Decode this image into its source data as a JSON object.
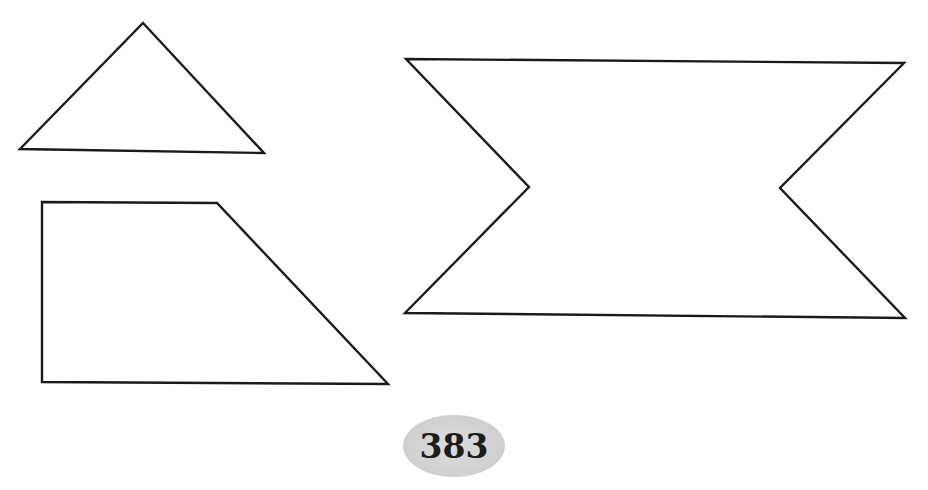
{
  "figure": {
    "shapes": [
      {
        "name": "triangle",
        "points": "143,23 264,153 20,149"
      },
      {
        "name": "trapezoid",
        "points": "42,202 217,203 388,384 42,382"
      },
      {
        "name": "notched-banner",
        "points": "406,59 904,63 780,188 905,318 405,313 529,187"
      }
    ],
    "stroke_color": "#1a1a1a",
    "fill_color": "#ffffff"
  },
  "page": {
    "number": "383",
    "badge_color": "#d3d3d3"
  }
}
